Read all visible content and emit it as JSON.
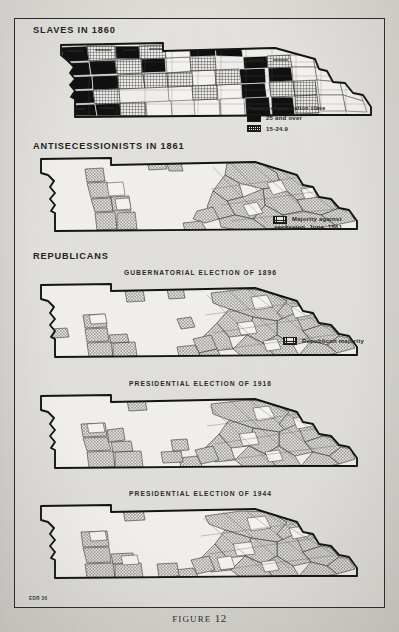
{
  "figure": {
    "caption_prefix": "FIGURE",
    "caption_number": "12",
    "source_code": "EDR 36"
  },
  "sections": [
    {
      "id": "slaves-1860",
      "header": "SLAVES IN 1860",
      "subtitle": "",
      "legend": {
        "title": "Percent of population slave",
        "items": [
          {
            "label": "25 and over",
            "pattern": "solid-black"
          },
          {
            "label": "15-24.9",
            "pattern": "crosshatch"
          }
        ]
      }
    },
    {
      "id": "antisecessionists-1861",
      "header": "ANTISECESSIONISTS IN 1861",
      "subtitle": "",
      "legend": {
        "title": "",
        "items": [
          {
            "label": "Majority against",
            "label2": "secession, June, 1861",
            "pattern": "stipple"
          }
        ]
      }
    },
    {
      "id": "republicans-1896",
      "header": "REPUBLICANS",
      "subtitle": "GUBERNATORIAL ELECTION OF 1896",
      "legend": {
        "title": "",
        "items": [
          {
            "label": "Republican majority",
            "pattern": "stipple"
          }
        ]
      }
    },
    {
      "id": "republicans-1916",
      "header": "",
      "subtitle": "PRESIDENTIAL ELECTION OF 1916",
      "legend": {
        "title": "",
        "items": []
      }
    },
    {
      "id": "republicans-1944",
      "header": "",
      "subtitle": "PRESIDENTIAL ELECTION OF 1944",
      "legend": {
        "title": "",
        "items": []
      }
    }
  ],
  "colors": {
    "paper": "#d8d6d1",
    "ink": "#1a1a1a",
    "frame": "#2b2b2b"
  }
}
